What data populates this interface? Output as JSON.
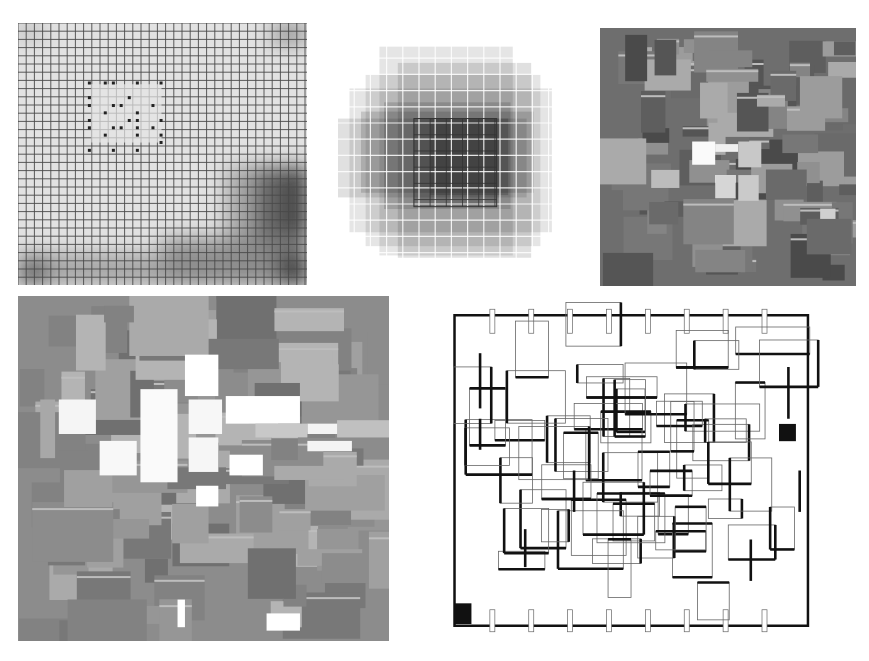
{
  "figure": {
    "width": 869,
    "height": 661,
    "background": "#ffffff",
    "panels": [
      {
        "id": "grid-gradient",
        "kind": "line-grid-with-dots",
        "x": 18,
        "y": 23,
        "w": 289,
        "h": 262,
        "pitch": 8.2,
        "line_color": "#4a4a4a",
        "base_fill": "#e2e2e2",
        "shading": [
          {
            "x": 0.88,
            "y": 0.0,
            "w": 0.12,
            "h": 0.08,
            "color": "#8a8a8a"
          },
          {
            "x": 0.0,
            "y": 0.0,
            "w": 0.08,
            "h": 0.06,
            "color": "#b0b0b0"
          },
          {
            "x": 0.72,
            "y": 0.55,
            "w": 0.28,
            "h": 0.45,
            "color": "#9a9a9a"
          },
          {
            "x": 0.82,
            "y": 0.55,
            "w": 0.18,
            "h": 0.45,
            "color": "#5a5a5a"
          },
          {
            "x": 0.93,
            "y": 0.55,
            "w": 0.07,
            "h": 0.45,
            "color": "#303030"
          },
          {
            "x": 0.0,
            "y": 0.88,
            "w": 1.0,
            "h": 0.12,
            "color": "#9a9a9a"
          },
          {
            "x": 0.5,
            "y": 0.82,
            "w": 0.5,
            "h": 0.18,
            "color": "#8a8a8a"
          },
          {
            "x": 0.0,
            "y": 0.9,
            "w": 0.1,
            "h": 0.1,
            "color": "#5c5c5c"
          },
          {
            "x": 0.9,
            "y": 0.88,
            "w": 0.1,
            "h": 0.12,
            "color": "#2a2a2a"
          }
        ],
        "cleared_region": {
          "x": 0.25,
          "y": 0.23,
          "w": 0.25,
          "h": 0.23,
          "color": "#e6e6e6"
        },
        "dots": [
          [
            0.247,
            0.229
          ],
          [
            0.302,
            0.229
          ],
          [
            0.33,
            0.229
          ],
          [
            0.413,
            0.229
          ],
          [
            0.495,
            0.229
          ],
          [
            0.247,
            0.285
          ],
          [
            0.385,
            0.285
          ],
          [
            0.247,
            0.315
          ],
          [
            0.33,
            0.315
          ],
          [
            0.357,
            0.315
          ],
          [
            0.467,
            0.315
          ],
          [
            0.302,
            0.343
          ],
          [
            0.413,
            0.343
          ],
          [
            0.247,
            0.372
          ],
          [
            0.385,
            0.372
          ],
          [
            0.413,
            0.372
          ],
          [
            0.495,
            0.372
          ],
          [
            0.247,
            0.4
          ],
          [
            0.33,
            0.4
          ],
          [
            0.357,
            0.4
          ],
          [
            0.413,
            0.4
          ],
          [
            0.467,
            0.4
          ],
          [
            0.302,
            0.428
          ],
          [
            0.413,
            0.428
          ],
          [
            0.495,
            0.428
          ],
          [
            0.495,
            0.456
          ],
          [
            0.247,
            0.486
          ],
          [
            0.33,
            0.486
          ],
          [
            0.413,
            0.486
          ]
        ],
        "dot_color": "#222222"
      },
      {
        "id": "radial-squares",
        "kind": "stacked-translucent-squares",
        "x": 338,
        "y": 42,
        "w": 230,
        "h": 232,
        "pitch": 16.2,
        "grid_line_color": "#ffffff",
        "square_color": "#000000",
        "layers": [
          {
            "x": 0.26,
            "y": 0.09,
            "w": 0.58,
            "h": 0.84,
            "opacity": 0.12
          },
          {
            "x": 0.18,
            "y": 0.02,
            "w": 0.58,
            "h": 0.9,
            "opacity": 0.1
          },
          {
            "x": 0.0,
            "y": 0.33,
            "w": 0.82,
            "h": 0.34,
            "opacity": 0.12
          },
          {
            "x": 0.05,
            "y": 0.2,
            "w": 0.88,
            "h": 0.62,
            "opacity": 0.1
          },
          {
            "x": 0.12,
            "y": 0.14,
            "w": 0.76,
            "h": 0.74,
            "opacity": 0.1
          },
          {
            "x": 0.1,
            "y": 0.3,
            "w": 0.75,
            "h": 0.35,
            "opacity": 0.14
          },
          {
            "x": 0.2,
            "y": 0.26,
            "w": 0.55,
            "h": 0.46,
            "opacity": 0.14
          },
          {
            "x": 0.33,
            "y": 0.33,
            "w": 0.36,
            "h": 0.38,
            "opacity": 0.2
          },
          {
            "x": 0.4,
            "y": 0.33,
            "w": 0.34,
            "h": 0.33,
            "opacity": 0.18
          }
        ],
        "outlined_cells": {
          "x": 0.33,
          "y": 0.33,
          "w": 0.36,
          "h": 0.38,
          "stroke": "#333333"
        }
      },
      {
        "id": "gray-tiles-small",
        "kind": "tile-mosaic",
        "x": 600,
        "y": 28,
        "w": 256,
        "h": 258,
        "background": "#6e6e6e",
        "seed": 17,
        "count": 95,
        "palette": [
          "#4a4a4a",
          "#555555",
          "#5e5e5e",
          "#6a6a6a",
          "#777777",
          "#848484",
          "#909090",
          "#9c9c9c",
          "#aaaaaa"
        ],
        "highlights": [
          {
            "x": 0.36,
            "y": 0.44,
            "w": 0.09,
            "h": 0.09,
            "color": "#fafafa"
          },
          {
            "x": 0.45,
            "y": 0.45,
            "w": 0.09,
            "h": 0.03,
            "color": "#f0f0f0"
          },
          {
            "x": 0.54,
            "y": 0.44,
            "w": 0.09,
            "h": 0.1,
            "color": "#c8c8c8"
          },
          {
            "x": 0.45,
            "y": 0.57,
            "w": 0.08,
            "h": 0.03,
            "color": "#ffffff"
          },
          {
            "x": 0.45,
            "y": 0.57,
            "w": 0.08,
            "h": 0.09,
            "color": "#d6d6d6"
          },
          {
            "x": 0.54,
            "y": 0.57,
            "w": 0.08,
            "h": 0.1,
            "color": "#cacaca"
          },
          {
            "x": 0.2,
            "y": 0.55,
            "w": 0.11,
            "h": 0.07,
            "color": "#bcbcbc"
          },
          {
            "x": 0.86,
            "y": 0.7,
            "w": 0.06,
            "h": 0.04,
            "color": "#d0d0d0"
          }
        ]
      },
      {
        "id": "gray-tiles-large",
        "kind": "tile-mosaic",
        "x": 18,
        "y": 296,
        "w": 371,
        "h": 345,
        "background": "#8c8c8c",
        "seed": 41,
        "count": 110,
        "palette": [
          "#707070",
          "#787878",
          "#828282",
          "#8c8c8c",
          "#969696",
          "#a0a0a0",
          "#aaaaaa",
          "#b4b4b4"
        ],
        "highlights": [
          {
            "x": 0.33,
            "y": 0.27,
            "w": 0.1,
            "h": 0.27,
            "color": "#fafafa"
          },
          {
            "x": 0.45,
            "y": 0.17,
            "w": 0.09,
            "h": 0.12,
            "color": "#ffffff"
          },
          {
            "x": 0.11,
            "y": 0.3,
            "w": 0.1,
            "h": 0.1,
            "color": "#f5f5f5"
          },
          {
            "x": 0.22,
            "y": 0.42,
            "w": 0.1,
            "h": 0.1,
            "color": "#f8f8f8"
          },
          {
            "x": 0.46,
            "y": 0.3,
            "w": 0.09,
            "h": 0.1,
            "color": "#f7f7f7"
          },
          {
            "x": 0.56,
            "y": 0.29,
            "w": 0.2,
            "h": 0.08,
            "color": "#ffffff"
          },
          {
            "x": 0.46,
            "y": 0.41,
            "w": 0.08,
            "h": 0.1,
            "color": "#f6f6f6"
          },
          {
            "x": 0.57,
            "y": 0.46,
            "w": 0.09,
            "h": 0.06,
            "color": "#ffffff"
          },
          {
            "x": 0.48,
            "y": 0.55,
            "w": 0.06,
            "h": 0.06,
            "color": "#ffffff"
          },
          {
            "x": 0.78,
            "y": 0.37,
            "w": 0.09,
            "h": 0.03,
            "color": "#f4f4f4"
          },
          {
            "x": 0.78,
            "y": 0.42,
            "w": 0.12,
            "h": 0.03,
            "color": "#f4f4f4"
          },
          {
            "x": 0.67,
            "y": 0.92,
            "w": 0.09,
            "h": 0.05,
            "color": "#ffffff"
          },
          {
            "x": 0.43,
            "y": 0.88,
            "w": 0.02,
            "h": 0.08,
            "color": "#ffffff"
          },
          {
            "x": 0.64,
            "y": 0.37,
            "w": 0.14,
            "h": 0.04,
            "color": "#c8c8c8"
          },
          {
            "x": 0.86,
            "y": 0.36,
            "w": 0.14,
            "h": 0.05,
            "color": "#c0c0c0"
          },
          {
            "x": 0.06,
            "y": 0.3,
            "w": 0.04,
            "h": 0.17,
            "color": "#a8a8a8"
          }
        ]
      },
      {
        "id": "floor-plan",
        "kind": "line-plan",
        "x": 450,
        "y": 298,
        "w": 376,
        "h": 345,
        "background": "#ffffff",
        "thick_color": "#111111",
        "thin_color": "#666666",
        "filled_blocks": [
          {
            "x": 0.012,
            "y": 0.885,
            "w": 0.045,
            "h": 0.06
          },
          {
            "x": 0.875,
            "y": 0.365,
            "w": 0.045,
            "h": 0.05
          }
        ],
        "outer_frame": {
          "x": 0.012,
          "y": 0.05,
          "w": 0.94,
          "h": 0.9
        },
        "seed": 7,
        "rect_count": 62
      }
    ]
  }
}
